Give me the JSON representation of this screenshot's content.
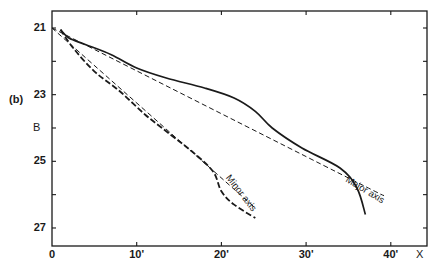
{
  "chart_data": {
    "type": "line",
    "panel_label": "(b)",
    "title": "",
    "xlabel": "X",
    "ylabel": "B",
    "x_unit": "arcmin",
    "xlim": [
      0,
      44
    ],
    "ylim": [
      27.5,
      20.5
    ],
    "y_inverted": true,
    "grid": false,
    "x_ticks": [
      0,
      10,
      20,
      30,
      40
    ],
    "x_tick_labels": [
      "0",
      "10'",
      "20'",
      "30'",
      "40'"
    ],
    "y_ticks": [
      21,
      23,
      25,
      27
    ],
    "y_tick_labels": [
      "21",
      "23",
      "25",
      "27"
    ],
    "series": [
      {
        "name": "Major axis profile",
        "style": "solid",
        "x": [
          1,
          2,
          4,
          7,
          10,
          13.5,
          18,
          21.5,
          24,
          26,
          29.5,
          34,
          36,
          37
        ],
        "y": [
          21.05,
          21.3,
          21.5,
          21.8,
          22.2,
          22.5,
          22.8,
          23.1,
          23.5,
          24.0,
          24.6,
          25.2,
          25.8,
          26.6
        ]
      },
      {
        "name": "Major axis fit",
        "style": "dashed",
        "x": [
          0,
          35,
          39
        ],
        "y": [
          21.0,
          25.5,
          26.0
        ]
      },
      {
        "name": "Minor axis profile",
        "style": "dashed-bold",
        "x": [
          1,
          2.5,
          5,
          8,
          11,
          14,
          16.5,
          19,
          20,
          21.5,
          24
        ],
        "y": [
          21.05,
          21.6,
          22.3,
          22.9,
          23.6,
          24.2,
          24.7,
          25.3,
          25.9,
          26.3,
          26.7
        ]
      },
      {
        "name": "Minor axis fit",
        "style": "dashed",
        "x": [
          0,
          24
        ],
        "y": [
          21.0,
          26.4
        ]
      }
    ],
    "annotations": [
      {
        "text": "Minor axis",
        "x": 20.5,
        "y": 25.2,
        "rotation": 50
      },
      {
        "text": "Major axis",
        "x": 34.5,
        "y": 25.0,
        "rotation": 30
      }
    ]
  },
  "labels": {
    "panel": "(b)",
    "y_axis_name": "B",
    "x_axis_name": "X",
    "minor": "Minor axis",
    "major": "Major axis"
  }
}
